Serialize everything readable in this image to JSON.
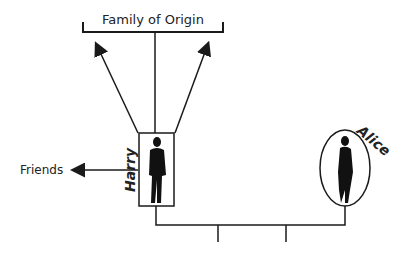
{
  "diagram": {
    "family_label": "Family of Origin",
    "friends_label": "Friends",
    "person_left": {
      "name": "Harry",
      "shape": "rectangle"
    },
    "person_right": {
      "name": "Alice",
      "shape": "ellipse"
    },
    "children_count": 2,
    "colors": {
      "line": "#1a1a1a",
      "background": "#ffffff"
    }
  }
}
